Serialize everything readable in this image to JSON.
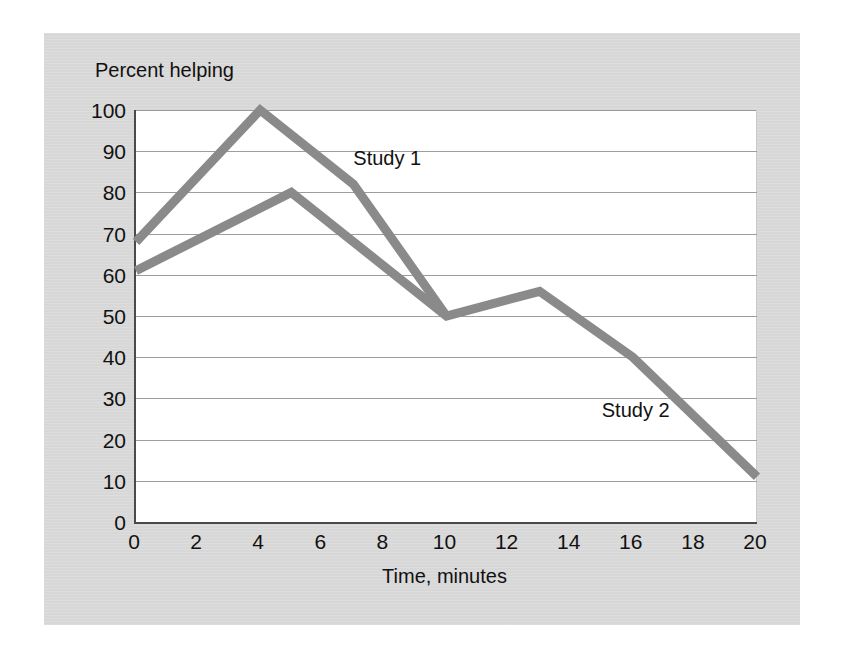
{
  "chart_data": {
    "type": "line",
    "title": "",
    "subtitle": "",
    "xlabel": "Time, minutes",
    "ylabel": "Percent helping",
    "xlim": [
      0,
      20
    ],
    "ylim": [
      0,
      100
    ],
    "xticks": [
      0,
      2,
      4,
      6,
      8,
      10,
      12,
      14,
      16,
      18,
      20
    ],
    "yticks": [
      0,
      10,
      20,
      30,
      40,
      50,
      60,
      70,
      80,
      90,
      100
    ],
    "xtick_labels": [
      "0",
      "2",
      "4",
      "6",
      "8",
      "10",
      "12",
      "14",
      "16",
      "18",
      "20"
    ],
    "ytick_labels": [
      "0",
      "10",
      "20",
      "30",
      "40",
      "50",
      "60",
      "70",
      "80",
      "90",
      "100"
    ],
    "grid": "horizontal",
    "legend_position": "inline-annotations",
    "series": [
      {
        "name": "Study 1",
        "color": "#8a8a8a",
        "points": [
          {
            "x": 0,
            "y": 68
          },
          {
            "x": 4,
            "y": 100
          },
          {
            "x": 7,
            "y": 82
          },
          {
            "x": 10,
            "y": 50
          }
        ],
        "annotation": "Study 1"
      },
      {
        "name": "Study 2",
        "color": "#8a8a8a",
        "points": [
          {
            "x": 0,
            "y": 61
          },
          {
            "x": 5,
            "y": 80
          },
          {
            "x": 10,
            "y": 50
          },
          {
            "x": 13,
            "y": 56
          },
          {
            "x": 16,
            "y": 40
          },
          {
            "x": 20,
            "y": 11
          }
        ],
        "annotation": "Study 2"
      }
    ],
    "annotations": [
      {
        "text": "Study 1",
        "x": 7.0,
        "y": 88
      },
      {
        "text": "Study 2",
        "x": 15.0,
        "y": 27
      }
    ]
  },
  "figure": {
    "panel_background": "#d9d9d9",
    "plot_background": "#ffffff",
    "axis_color": "#4a4a4a",
    "gridline_color": "#9d9d9d",
    "line_color": "#8a8a8a",
    "text_color": "#111111"
  }
}
